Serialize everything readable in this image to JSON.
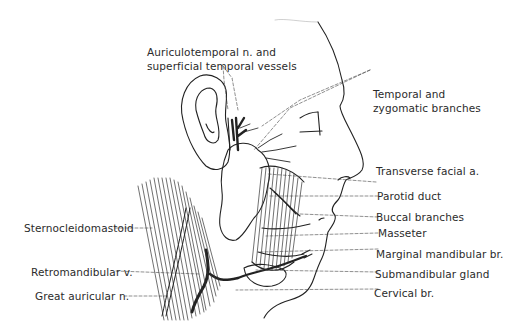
{
  "figure": {
    "labels": {
      "auriculotemporal": {
        "line1": "Auriculotemporal n. and",
        "line2": "superficial temporal vessels"
      },
      "temporal_zygomatic": {
        "line1": "Temporal and",
        "line2": "zygomatic branches"
      },
      "transverse_facial": "Transverse facial a.",
      "parotid_duct": "Parotid duct",
      "buccal": "Buccal branches",
      "masseter": "Masseter",
      "marginal_mandibular": "Marginal mandibular br.",
      "submandibular": "Submandibular gland",
      "cervical": "Cervical br.",
      "sternocleidomastoid": "Sternocleidomastoid",
      "retromandibular": "Retromandibular v.",
      "great_auricular": "Great auricular n."
    }
  }
}
